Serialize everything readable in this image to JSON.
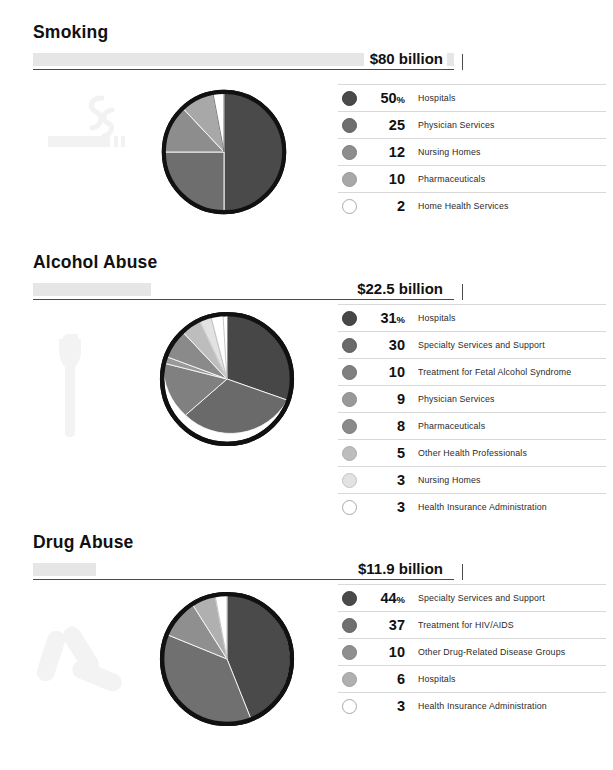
{
  "chart_data": [
    {
      "type": "pie",
      "title": "Smoking",
      "total_label": "$80 billion",
      "total_value": 80,
      "units": "billion USD",
      "icon": "cigarette-icon",
      "bar_max": 80,
      "categories": [
        "Hospitals",
        "Physician Services",
        "Nursing Homes",
        "Pharmaceuticals",
        "Home Health Services"
      ],
      "values": [
        50,
        25,
        12,
        10,
        2
      ],
      "value_suffix_first": "%",
      "colors": [
        "#4a4a4a",
        "#6e6e6e",
        "#8d8d8d",
        "#a8a8a8",
        "#ffffff"
      ],
      "legend_position": "right",
      "grid": false
    },
    {
      "type": "pie",
      "title": "Alcohol Abuse",
      "total_label": "$22.5 billion",
      "total_value": 22.5,
      "units": "billion USD",
      "icon": "bottle-icon",
      "bar_max": 80,
      "categories": [
        "Hospitals",
        "Specialty Services and Support",
        "Treatment for Fetal Alcohol Syndrome",
        "Physician Services",
        "Pharmaceuticals",
        "Other Health Professionals",
        "Nursing Homes",
        "Health Insurance Administration"
      ],
      "values": [
        31,
        30,
        10,
        9,
        8,
        5,
        3,
        3
      ],
      "value_suffix_first": "%",
      "colors": [
        "#474747",
        "#6a6a6a",
        "#808080",
        "#999999",
        "#8a8a8a",
        "#bdbdbd",
        "#e2e2e2",
        "#ffffff"
      ],
      "legend_position": "right",
      "grid": false
    },
    {
      "type": "pie",
      "title": "Drug Abuse",
      "total_label": "$11.9 billion",
      "total_value": 11.9,
      "units": "billion USD",
      "icon": "pills-icon",
      "bar_max": 80,
      "categories": [
        "Specialty Services and Support",
        "Treatment for HIV/AIDS",
        "Other Drug-Related Disease Groups",
        "Hospitals",
        "Health Insurance Administration"
      ],
      "values": [
        44,
        37,
        10,
        6,
        3
      ],
      "value_suffix_first": "%",
      "colors": [
        "#4a4a4a",
        "#707070",
        "#8f8f8f",
        "#b0b0b0",
        "#ffffff"
      ],
      "legend_position": "right",
      "grid": false
    }
  ],
  "sections": [
    {
      "title": "Smoking",
      "amount": "$80 billion",
      "icon_name": "cigarette-icon",
      "legend": [
        {
          "value": "50",
          "pct": "%",
          "label": "Hospitals"
        },
        {
          "value": "25",
          "pct": "",
          "label": "Physician Services"
        },
        {
          "value": "12",
          "pct": "",
          "label": "Nursing Homes"
        },
        {
          "value": "10",
          "pct": "",
          "label": "Pharmaceuticals"
        },
        {
          "value": "2",
          "pct": "",
          "label": "Home Health Services"
        }
      ]
    },
    {
      "title": "Alcohol Abuse",
      "amount": "$22.5 billion",
      "icon_name": "bottle-icon",
      "legend": [
        {
          "value": "31",
          "pct": "%",
          "label": "Hospitals"
        },
        {
          "value": "30",
          "pct": "",
          "label": "Specialty Services and Support"
        },
        {
          "value": "10",
          "pct": "",
          "label": "Treatment for Fetal Alcohol Syndrome"
        },
        {
          "value": "9",
          "pct": "",
          "label": "Physician Services"
        },
        {
          "value": "8",
          "pct": "",
          "label": "Pharmaceuticals"
        },
        {
          "value": "5",
          "pct": "",
          "label": "Other Health Professionals"
        },
        {
          "value": "3",
          "pct": "",
          "label": "Nursing Homes"
        },
        {
          "value": "3",
          "pct": "",
          "label": "Health Insurance Administration"
        }
      ]
    },
    {
      "title": "Drug Abuse",
      "amount": "$11.9 billion",
      "icon_name": "pills-icon",
      "legend": [
        {
          "value": "44",
          "pct": "%",
          "label": "Specialty Services and Support"
        },
        {
          "value": "37",
          "pct": "",
          "label": "Treatment for HIV/AIDS"
        },
        {
          "value": "10",
          "pct": "",
          "label": "Other Drug-Related Disease Groups"
        },
        {
          "value": "6",
          "pct": "",
          "label": "Hospitals"
        },
        {
          "value": "3",
          "pct": "",
          "label": "Health Insurance Administration"
        }
      ]
    }
  ],
  "style": {
    "bar_fill_color": "#e6e6e6",
    "rule_color": "#4a4a4a",
    "deco_icon_color": "#f4f4f4",
    "pie_outline_color": "#111111"
  }
}
